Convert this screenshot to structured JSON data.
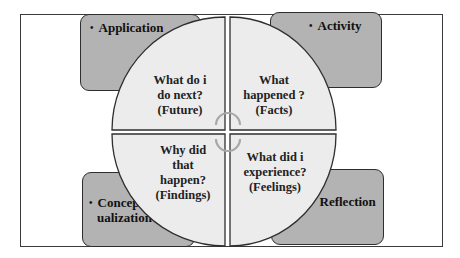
{
  "diagram": {
    "type": "reflective-learning-cycle",
    "center_marker": "circular-arrows-cycle",
    "colors": {
      "box_fill": "#b3b3b3",
      "quadrant_fill": "#ececec",
      "outline": "#2e2e2e",
      "cycle_arc": "#a8a8a8"
    },
    "corner_boxes": [
      {
        "position": "top-left",
        "bullet": "•",
        "label": "Application"
      },
      {
        "position": "top-right",
        "bullet": "•",
        "label": "Activity"
      },
      {
        "position": "bottom-left",
        "bullet": "•",
        "label_line1": "Concept",
        "label_line2": "ualization"
      },
      {
        "position": "bottom-right",
        "bullet": "•",
        "label": "Reflection"
      }
    ],
    "quadrants": [
      {
        "position": "top-left",
        "lines": [
          "What do i",
          "do next?",
          "(Future)"
        ]
      },
      {
        "position": "top-right",
        "lines": [
          "What",
          "happened ?",
          "(Facts)"
        ]
      },
      {
        "position": "bottom-left",
        "lines": [
          "Why did",
          "that",
          "happen?",
          "(Findings)"
        ]
      },
      {
        "position": "bottom-right",
        "lines": [
          "What did i",
          "experience?",
          "(Feelings)"
        ]
      }
    ]
  }
}
